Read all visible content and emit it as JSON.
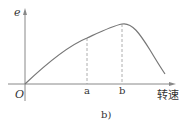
{
  "diagram": {
    "y_axis_label": "e",
    "x_axis_label": "转速",
    "origin_label": "O",
    "markers": [
      {
        "label": "a"
      },
      {
        "label": "b"
      }
    ],
    "caption": "b)",
    "colors": {
      "curve": "#777777",
      "axis": "#888888",
      "dashed": "#999999",
      "text": "#333333"
    }
  }
}
